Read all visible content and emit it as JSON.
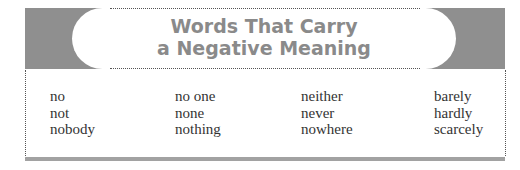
{
  "title": {
    "line1": "Words That Carry",
    "line2": "a Negative Meaning"
  },
  "columns": [
    [
      "no",
      "not",
      "nobody"
    ],
    [
      "no one",
      "none",
      "nothing"
    ],
    [
      "neither",
      "never",
      "nowhere"
    ],
    [
      "barely",
      "hardly",
      "scarcely"
    ]
  ],
  "colors": {
    "header_block": "#8f8f8f",
    "title_text": "#8a8a8a",
    "bottom_bar": "#a2a2a2"
  }
}
